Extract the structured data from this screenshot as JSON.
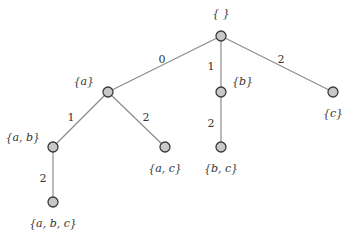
{
  "diagram": {
    "type": "tree",
    "nodes": [
      {
        "id": "root",
        "label": "{ }",
        "x": 221,
        "y": 36,
        "lx": 221,
        "ly": 14,
        "anchor": "middle"
      },
      {
        "id": "a",
        "label": "{a}",
        "x": 108,
        "y": 92,
        "lx": 94,
        "ly": 82,
        "anchor": "end"
      },
      {
        "id": "b",
        "label": "{b}",
        "x": 221,
        "y": 92,
        "lx": 232,
        "ly": 82,
        "anchor": "start"
      },
      {
        "id": "c",
        "label": "{c}",
        "x": 333,
        "y": 92,
        "lx": 333,
        "ly": 114,
        "anchor": "middle"
      },
      {
        "id": "ab",
        "label": "{a, b}",
        "x": 53,
        "y": 147,
        "lx": 40,
        "ly": 138,
        "anchor": "end"
      },
      {
        "id": "ac",
        "label": "{a, c}",
        "x": 165,
        "y": 147,
        "lx": 165,
        "ly": 169,
        "anchor": "middle"
      },
      {
        "id": "bc",
        "label": "{b, c}",
        "x": 221,
        "y": 147,
        "lx": 221,
        "ly": 169,
        "anchor": "middle"
      },
      {
        "id": "abc",
        "label": "{a, b, c}",
        "x": 53,
        "y": 202,
        "lx": 53,
        "ly": 224,
        "anchor": "middle"
      }
    ],
    "edges": [
      {
        "from": "root",
        "to": "a",
        "label": "0",
        "lx": 162,
        "ly": 60
      },
      {
        "from": "root",
        "to": "b",
        "label": "1",
        "lx": 211,
        "ly": 67
      },
      {
        "from": "root",
        "to": "c",
        "label": "2",
        "lx": 281,
        "ly": 60
      },
      {
        "from": "a",
        "to": "ab",
        "label": "1",
        "lx": 71,
        "ly": 118
      },
      {
        "from": "a",
        "to": "ac",
        "label": "2",
        "lx": 146,
        "ly": 118
      },
      {
        "from": "b",
        "to": "bc",
        "label": "2",
        "lx": 211,
        "ly": 124
      },
      {
        "from": "ab",
        "to": "abc",
        "label": "2",
        "lx": 43,
        "ly": 179
      }
    ]
  }
}
